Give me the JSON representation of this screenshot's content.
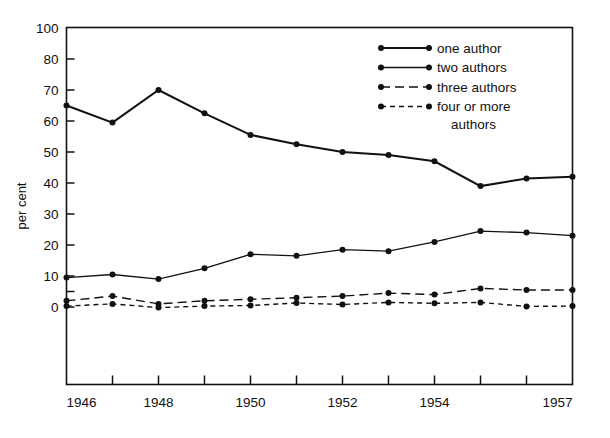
{
  "chart_data": {
    "type": "line",
    "title": "",
    "xlabel": "",
    "ylabel": "per cent",
    "x": [
      1946,
      1947,
      1948,
      1949,
      1950,
      1951,
      1952,
      1953,
      1954,
      1955,
      1956,
      1957
    ],
    "xtick_labels": [
      "1946",
      "1948",
      "1950",
      "1952",
      "1954",
      "1957"
    ],
    "xtick_values": [
      1946,
      1948,
      1950,
      1952,
      1954,
      1957
    ],
    "xlim": [
      1946,
      1957
    ],
    "ytick_labels": [
      "100",
      "80",
      "70",
      "60",
      "50",
      "40",
      "30",
      "20",
      "10",
      "",
      "0"
    ],
    "ytick_values": [
      100,
      80,
      70,
      60,
      50,
      40,
      30,
      20,
      10,
      5,
      0
    ],
    "ylim": [
      0,
      100
    ],
    "y_axis_note": "broken scale: 80-100 compressed into one interval",
    "grid": false,
    "legend_position": "top-right",
    "series": [
      {
        "name": "one author",
        "style": "solid-thick",
        "values": [
          65,
          59.5,
          70,
          62.5,
          55.5,
          52.5,
          50,
          49,
          47,
          39,
          41.5,
          42
        ]
      },
      {
        "name": "two authors",
        "style": "solid-thin",
        "values": [
          9.5,
          10.5,
          9,
          12.5,
          17,
          16.5,
          18.5,
          18,
          21,
          24.5,
          24,
          23
        ]
      },
      {
        "name": "three authors",
        "style": "long-dash",
        "values": [
          2,
          3.5,
          1,
          2,
          2.5,
          3,
          3.5,
          4.5,
          4,
          6,
          5.5,
          5.5
        ]
      },
      {
        "name": "four or more authors",
        "style": "short-dash",
        "values": [
          0.3,
          1,
          -0.2,
          0.3,
          0.5,
          1.3,
          0.8,
          1.5,
          1.2,
          1.5,
          0.2,
          0.3
        ]
      }
    ]
  },
  "legend": {
    "entries": [
      {
        "label": "one author"
      },
      {
        "label": "two authors"
      },
      {
        "label": "three authors"
      },
      {
        "label": "four or more"
      },
      {
        "label": "authors"
      }
    ]
  },
  "axes": {
    "y_title": "per cent"
  }
}
